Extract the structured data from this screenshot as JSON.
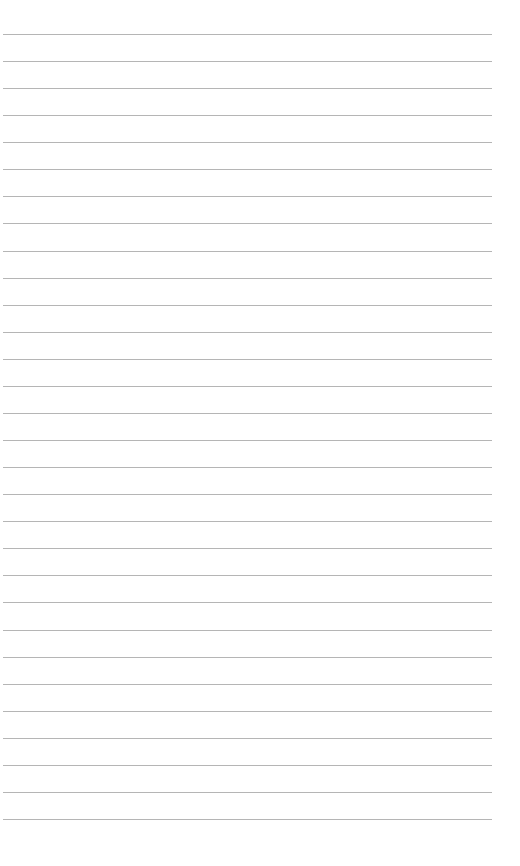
{
  "page": {
    "type": "lined-paper",
    "background_color": "#ffffff",
    "line_color": "#b5b5b5",
    "line_count": 30,
    "first_line_y": 34,
    "line_spacing": 27.07,
    "line_left": 3,
    "line_width": 489,
    "text": []
  }
}
